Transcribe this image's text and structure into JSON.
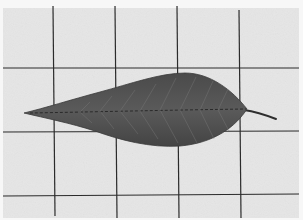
{
  "image": {
    "subject": "leaf on grid paper",
    "palette": {
      "paper": "#e6e6e6",
      "margin": "#f6f6f6",
      "grid_line": "#2b2b2b",
      "leaf_fill": "#555555",
      "leaf_dark": "#3f3f3f",
      "vein": "#8a8a8a",
      "stem": "#2e2e2e"
    }
  }
}
